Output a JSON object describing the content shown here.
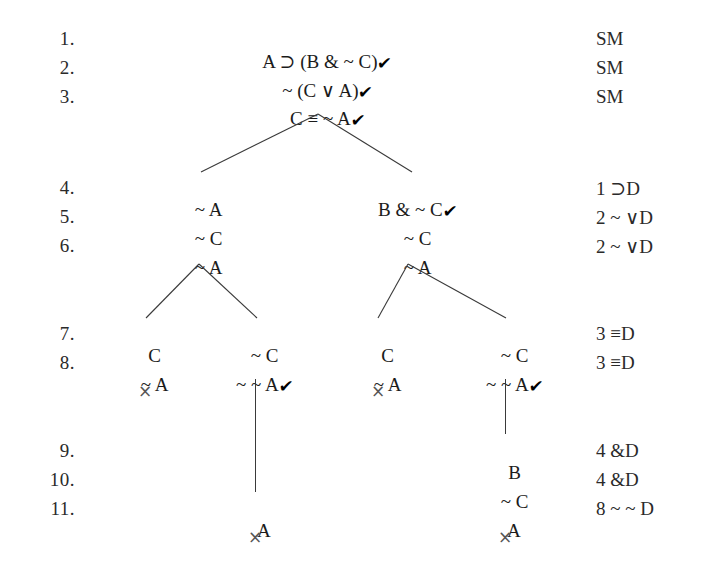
{
  "document": {
    "kind": "truth-tree",
    "symbols": {
      "check": "✔",
      "cross": "×",
      "horseshoe": "⊃",
      "wedge": "∨",
      "triple_bar": "≡",
      "ampersand": "&",
      "tilde": "~"
    }
  },
  "rows": [
    {
      "number": "1.",
      "justification": "SM"
    },
    {
      "number": "2.",
      "justification": "SM"
    },
    {
      "number": "3.",
      "justification": "SM"
    },
    {
      "number": "4.",
      "justification": "1 ⊃D"
    },
    {
      "number": "5.",
      "justification": "2 ~ ∨D"
    },
    {
      "number": "6.",
      "justification": "2 ~ ∨D"
    },
    {
      "number": "7.",
      "justification": "3 ≡D"
    },
    {
      "number": "8.",
      "justification": "3 ≡D"
    },
    {
      "number": "9.",
      "justification": "4 &D"
    },
    {
      "number": "10.",
      "justification": "4 &D"
    },
    {
      "number": "11.",
      "justification": "8 ~ ~ D"
    }
  ],
  "trunk": [
    {
      "row": 1,
      "text": "A ⊃ (B & ~ C)",
      "checked": true
    },
    {
      "row": 2,
      "text": "~ (C ∨ A)",
      "checked": true
    },
    {
      "row": 3,
      "text": "C ≡ ~ A",
      "checked": true
    }
  ],
  "level2": {
    "left": [
      {
        "row": 4,
        "text": "~ A",
        "checked": false
      },
      {
        "row": 5,
        "text": "~ C",
        "checked": false
      },
      {
        "row": 6,
        "text": "~ A",
        "checked": false
      }
    ],
    "right": [
      {
        "row": 4,
        "text": "B & ~ C",
        "checked": true
      },
      {
        "row": 5,
        "text": "~ C",
        "checked": false
      },
      {
        "row": 6,
        "text": "~ A",
        "checked": false
      }
    ]
  },
  "branches": [
    {
      "id": "branch-1",
      "row7": {
        "text": "C",
        "checked": false
      },
      "row8": {
        "text": "~ A",
        "checked": false
      },
      "closed": true,
      "close_mark": "×",
      "extension": []
    },
    {
      "id": "branch-2",
      "row7": {
        "text": "~ C",
        "checked": false
      },
      "row8": {
        "text": "~ ~ A",
        "checked": true
      },
      "closed": true,
      "close_mark": "×",
      "extension": [
        {
          "row": 11,
          "text": "A",
          "checked": false
        }
      ]
    },
    {
      "id": "branch-3",
      "row7": {
        "text": "C",
        "checked": false
      },
      "row8": {
        "text": "~ A",
        "checked": false
      },
      "closed": true,
      "close_mark": "×",
      "extension": []
    },
    {
      "id": "branch-4",
      "row7": {
        "text": "~ C",
        "checked": false
      },
      "row8": {
        "text": "~ ~ A",
        "checked": true
      },
      "closed": true,
      "close_mark": "×",
      "extension": [
        {
          "row": 9,
          "text": "B",
          "checked": false
        },
        {
          "row": 10,
          "text": "~ C",
          "checked": false
        },
        {
          "row": 11,
          "text": "A",
          "checked": false
        }
      ]
    }
  ]
}
